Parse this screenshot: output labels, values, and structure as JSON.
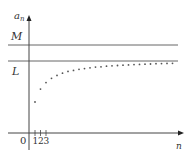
{
  "chart_data": {
    "type": "scatter",
    "title": "",
    "xlabel": "n",
    "ylabel": "a_n",
    "y_axis_label_main": "a",
    "y_axis_label_sub": "n",
    "origin_label": "0",
    "x_tick_labels": [
      "1",
      "2",
      "3"
    ],
    "horizontal_lines": [
      {
        "name": "M",
        "label": "M",
        "role": "upper bound"
      },
      {
        "name": "L",
        "label": "L",
        "role": "limit"
      }
    ],
    "x": [
      1,
      2,
      3,
      4,
      5,
      6,
      7,
      8,
      9,
      10,
      11,
      12,
      13,
      14,
      15,
      16,
      17,
      18,
      19,
      20,
      21,
      22,
      23,
      24,
      25,
      26
    ],
    "y_relative_to_L": [
      0.43,
      0.61,
      0.7,
      0.76,
      0.8,
      0.83,
      0.855,
      0.87,
      0.885,
      0.895,
      0.905,
      0.915,
      0.92,
      0.928,
      0.933,
      0.938,
      0.942,
      0.946,
      0.95,
      0.953,
      0.956,
      0.959,
      0.962,
      0.964,
      0.966,
      0.968
    ]
  },
  "colors": {
    "axis": "#444444",
    "line": "#666666",
    "point": "#555555"
  }
}
